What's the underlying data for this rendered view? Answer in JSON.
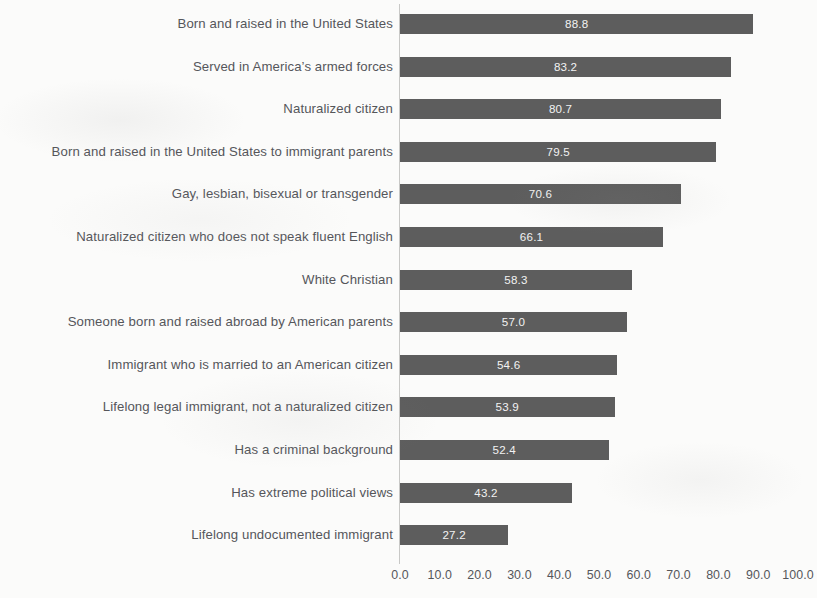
{
  "chart_data": {
    "type": "bar",
    "orientation": "horizontal",
    "title": "",
    "subtitle": "",
    "xlabel": "",
    "ylabel": "",
    "xlim": [
      0.0,
      100.0
    ],
    "xticks": [
      "0.0",
      "10.0",
      "20.0",
      "30.0",
      "40.0",
      "50.0",
      "60.0",
      "70.0",
      "80.0",
      "90.0",
      "100.0"
    ],
    "xtick_values": [
      0,
      10,
      20,
      30,
      40,
      50,
      60,
      70,
      80,
      90,
      100
    ],
    "grid": false,
    "legend": false,
    "legend_position": "none",
    "bar_color": "#5d5d5d",
    "value_label_color": "#f2f2f2",
    "axis_text_color": "#55565a",
    "background_color": "#fbfbfa",
    "categories": [
      "Born and raised in the United States",
      "Served in America’s armed forces",
      "Naturalized citizen",
      "Born and raised in the United States to immigrant parents",
      "Gay, lesbian, bisexual or transgender",
      "Naturalized citizen who does not speak fluent English",
      "White Christian",
      "Someone born and raised abroad by American parents",
      "Immigrant who is married to an American citizen",
      "Lifelong legal immigrant, not a naturalized citizen",
      "Has a criminal background",
      "Has extreme political views",
      "Lifelong undocumented immigrant"
    ],
    "values": [
      88.8,
      83.2,
      80.7,
      79.5,
      70.6,
      66.1,
      58.3,
      57.0,
      54.6,
      53.9,
      52.4,
      43.2,
      27.2
    ],
    "value_labels": [
      "88.8",
      "83.2",
      "80.7",
      "79.5",
      "70.6",
      "66.1",
      "58.3",
      "57.0",
      "54.6",
      "53.9",
      "52.4",
      "43.2",
      "27.2"
    ]
  }
}
